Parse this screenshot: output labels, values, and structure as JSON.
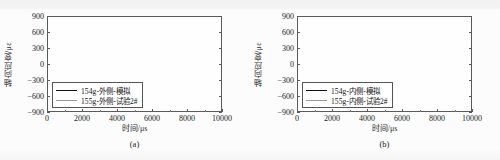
{
  "figure": {
    "background_color": "#fbfbfb",
    "axis_color": "#5a5a5a",
    "sim_color": "#111111",
    "exp_color": "#9a9a9a"
  },
  "panels": [
    {
      "id": "a",
      "caption": "(a)",
      "ylabel": "轴向应变/με",
      "xlabel": "时间/μs",
      "yticks": [
        "900",
        "600",
        "300",
        "0",
        "-300",
        "-600",
        "-900"
      ],
      "xticks": [
        "0",
        "2000",
        "4000",
        "6000",
        "8000",
        "10000"
      ],
      "legend": [
        {
          "label": "154g-外侧-模拟",
          "key": "sim"
        },
        {
          "label": "155g-外侧-试验2#",
          "key": "exp"
        }
      ]
    },
    {
      "id": "b",
      "caption": "(b)",
      "ylabel": "轴向应变/με",
      "xlabel": "时间/μs",
      "yticks": [
        "900",
        "600",
        "300",
        "0",
        "-300",
        "-600",
        "-900"
      ],
      "xticks": [
        "0",
        "2000",
        "4000",
        "6000",
        "8000",
        "10000"
      ],
      "legend": [
        {
          "label": "154g-内侧-模拟",
          "key": "sim"
        },
        {
          "label": "155g-内侧-试验2#",
          "key": "exp"
        }
      ]
    }
  ],
  "chart_data": [
    {
      "type": "line",
      "panel": "a",
      "title": "",
      "xlabel": "时间/μs",
      "ylabel": "轴向应变/με",
      "xlim": [
        0,
        10000
      ],
      "ylim": [
        -900,
        900
      ],
      "xticks": [
        0,
        2000,
        4000,
        6000,
        8000,
        10000
      ],
      "yticks": [
        -900,
        -600,
        -300,
        0,
        300,
        600,
        900
      ],
      "grid": false,
      "legend_position": "lower-left-inside",
      "series": [
        {
          "name": "154g-外侧-模拟",
          "color": "#111111",
          "x": [
            0,
            100,
            200,
            300,
            400,
            500,
            600,
            700,
            800,
            900,
            1000,
            1100,
            1200,
            1300,
            1400,
            1500,
            1600,
            1700,
            1800,
            1900,
            2000,
            2100,
            2200,
            2300,
            2400,
            2500,
            2600,
            2700,
            2800,
            2900,
            3000,
            3100,
            3200,
            3300,
            3400,
            3500,
            3600,
            3700,
            3800,
            3900,
            4000,
            4100,
            4200,
            4300,
            4400,
            4500,
            4600,
            4700,
            4800,
            4900,
            5000,
            5100,
            5200,
            5300,
            5400,
            5500,
            5600,
            5700,
            5800,
            5900,
            6000,
            6100,
            6200,
            6300,
            6400,
            6500,
            6600,
            6700,
            6800,
            6900,
            7000,
            7100,
            7200,
            7300,
            7400,
            7500,
            7600,
            7700,
            7800,
            7900,
            8000,
            8100,
            8200,
            8300,
            8400,
            8500,
            8600,
            8700,
            8800,
            8900,
            9000,
            9100,
            9200,
            9300,
            9400,
            9500,
            9600,
            9700,
            9800,
            9900,
            10000
          ],
          "values": [
            0,
            10,
            -20,
            30,
            -30,
            60,
            -90,
            -130,
            60,
            -60,
            100,
            -150,
            90,
            -40,
            130,
            -80,
            170,
            -140,
            210,
            -120,
            250,
            -170,
            330,
            -200,
            420,
            -230,
            520,
            -260,
            400,
            -280,
            560,
            -250,
            330,
            -300,
            450,
            -210,
            380,
            -270,
            310,
            -240,
            420,
            -200,
            330,
            -280,
            470,
            -230,
            360,
            -300,
            410,
            -250,
            330,
            -290,
            440,
            -220,
            370,
            -310,
            300,
            -260,
            420,
            -240,
            350,
            -300,
            330,
            -270,
            410,
            -230,
            480,
            -330,
            420,
            -290,
            520,
            -350,
            380,
            -300,
            470,
            -320,
            400,
            -280,
            450,
            -330,
            520,
            -300,
            380,
            -360,
            470,
            -320,
            550,
            -380,
            420,
            -330,
            610,
            -420,
            500,
            -360,
            680,
            -470,
            430,
            -330,
            520,
            -300,
            300
          ]
        },
        {
          "name": "155g-外侧-试验2#",
          "color": "#9a9a9a",
          "x": [
            0,
            100,
            200,
            300,
            400,
            500,
            600,
            700,
            800,
            900,
            1000,
            1100,
            1200,
            1300,
            1400,
            1500,
            1600,
            1700,
            1800,
            1900,
            2000,
            2100,
            2200,
            2300,
            2400,
            2500,
            2600,
            2700,
            2800,
            2900,
            3000,
            3100,
            3200,
            3300,
            3400,
            3500,
            3600,
            3700,
            3800,
            3900,
            4000,
            4100,
            4200,
            4300,
            4400,
            4500,
            4600,
            4700,
            4800,
            4900,
            5000,
            5100,
            5200,
            5300,
            5400,
            5500,
            5600,
            5700,
            5800,
            5900,
            6000,
            6100,
            6200,
            6300,
            6400,
            6500,
            6600,
            6700,
            6800,
            6900,
            7000,
            7100,
            7200,
            7300,
            7400,
            7500,
            7600,
            7700,
            7800,
            7900,
            8000,
            8100,
            8200,
            8300,
            8400,
            8500,
            8600,
            8700,
            8800,
            8900,
            9000,
            9100,
            9200,
            9300,
            9400,
            9500,
            9600,
            9700,
            9800,
            9900,
            10000
          ],
          "values": [
            0,
            5,
            -15,
            20,
            -40,
            40,
            -120,
            -290,
            30,
            -100,
            70,
            -190,
            60,
            -70,
            100,
            -120,
            140,
            -180,
            180,
            -160,
            220,
            -210,
            300,
            -240,
            390,
            -270,
            490,
            -300,
            370,
            -310,
            530,
            -280,
            300,
            -330,
            420,
            -250,
            350,
            -300,
            280,
            -270,
            390,
            -240,
            300,
            -310,
            440,
            -260,
            330,
            -330,
            380,
            -280,
            300,
            -320,
            410,
            -250,
            340,
            -340,
            270,
            -290,
            390,
            -270,
            320,
            -330,
            300,
            -300,
            380,
            -270,
            450,
            -360,
            390,
            -320,
            490,
            -380,
            350,
            -330,
            440,
            -350,
            370,
            -310,
            420,
            -360,
            490,
            -330,
            350,
            -390,
            440,
            -350,
            520,
            -410,
            390,
            -360,
            580,
            -450,
            470,
            -390,
            650,
            -500,
            400,
            -360,
            490,
            -330,
            270
          ]
        }
      ]
    },
    {
      "type": "line",
      "panel": "b",
      "title": "",
      "xlabel": "时间/μs",
      "ylabel": "轴向应变/με",
      "xlim": [
        0,
        10000
      ],
      "ylim": [
        -900,
        900
      ],
      "xticks": [
        0,
        2000,
        4000,
        6000,
        8000,
        10000
      ],
      "yticks": [
        -900,
        -600,
        -300,
        0,
        300,
        600,
        900
      ],
      "grid": false,
      "legend_position": "lower-left-inside",
      "series": [
        {
          "name": "154g-内侧-模拟",
          "color": "#111111",
          "x": [
            0,
            100,
            200,
            300,
            400,
            500,
            600,
            700,
            800,
            900,
            1000,
            1100,
            1200,
            1300,
            1400,
            1500,
            1600,
            1700,
            1800,
            1900,
            2000,
            2100,
            2200,
            2300,
            2400,
            2500,
            2600,
            2700,
            2800,
            2900,
            3000,
            3100,
            3200,
            3300,
            3400,
            3500,
            3600,
            3700,
            3800,
            3900,
            4000,
            4100,
            4200,
            4300,
            4400,
            4500,
            4600,
            4700,
            4800,
            4900,
            5000,
            5100,
            5200,
            5300,
            5400,
            5500,
            5600,
            5700,
            5800,
            5900,
            6000,
            6100,
            6200,
            6300,
            6400,
            6500,
            6600,
            6700,
            6800,
            6900,
            7000,
            7100,
            7200,
            7300,
            7400,
            7500,
            7600,
            7700,
            7800,
            7900,
            8000,
            8100,
            8200,
            8300,
            8400,
            8500,
            8600,
            8700,
            8800,
            8900,
            9000,
            9100,
            9200,
            9300,
            9400,
            9500,
            9600,
            9700,
            9800,
            9900,
            10000
          ],
          "values": [
            0,
            30,
            -20,
            60,
            20,
            120,
            60,
            180,
            90,
            250,
            120,
            330,
            180,
            520,
            240,
            400,
            160,
            300,
            120,
            380,
            200,
            560,
            300,
            620,
            280,
            400,
            180,
            -280,
            60,
            -310,
            200,
            520,
            260,
            340,
            140,
            260,
            80,
            200,
            120,
            300,
            160,
            240,
            60,
            180,
            40,
            220,
            100,
            300,
            140,
            380,
            180,
            260,
            100,
            520,
            200,
            620,
            300,
            380,
            160,
            300,
            200,
            620,
            280,
            400,
            180,
            300,
            120,
            380,
            160,
            280,
            100,
            220,
            140,
            300,
            180,
            360,
            120,
            260,
            80,
            -260,
            140,
            620,
            300,
            420,
            200,
            300,
            140,
            420,
            180,
            320,
            120,
            520,
            240,
            360,
            160,
            300,
            200,
            380,
            160,
            200
          ]
        },
        {
          "name": "155g-内侧-试验2#",
          "color": "#9a9a9a",
          "x": [
            0,
            100,
            200,
            300,
            400,
            500,
            600,
            700,
            800,
            900,
            1000,
            1100,
            1200,
            1300,
            1400,
            1500,
            1600,
            1700,
            1800,
            1900,
            2000,
            2100,
            2200,
            2300,
            2400,
            2500,
            2600,
            2700,
            2800,
            2900,
            3000,
            3100,
            3200,
            3300,
            3400,
            3500,
            3600,
            3700,
            3800,
            3900,
            4000,
            4100,
            4200,
            4300,
            4400,
            4500,
            4600,
            4700,
            4800,
            4900,
            5000,
            5100,
            5200,
            5300,
            5400,
            5500,
            5600,
            5700,
            5800,
            5900,
            6000,
            6100,
            6200,
            6300,
            6400,
            6500,
            6600,
            6700,
            6800,
            6900,
            7000,
            7100,
            7200,
            7300,
            7400,
            7500,
            7600,
            7700,
            7800,
            7900,
            8000,
            8100,
            8200,
            8300,
            8400,
            8500,
            8600,
            8700,
            8800,
            8900,
            9000,
            9100,
            9200,
            9300,
            9400,
            9500,
            9600,
            9700,
            9800,
            9900,
            10000
          ],
          "values": [
            0,
            -20,
            -60,
            10,
            -80,
            40,
            -60,
            90,
            -40,
            140,
            0,
            200,
            60,
            320,
            100,
            200,
            40,
            120,
            -20,
            180,
            60,
            300,
            120,
            380,
            100,
            200,
            20,
            -180,
            -40,
            -200,
            60,
            260,
            100,
            160,
            20,
            100,
            -40,
            60,
            0,
            140,
            40,
            100,
            -60,
            60,
            -80,
            100,
            0,
            160,
            40,
            220,
            60,
            140,
            -20,
            300,
            80,
            380,
            140,
            200,
            40,
            140,
            60,
            380,
            120,
            220,
            40,
            140,
            0,
            200,
            40,
            140,
            -20,
            100,
            20,
            160,
            60,
            200,
            20,
            120,
            -40,
            -160,
            40,
            360,
            140,
            240,
            80,
            160,
            40,
            240,
            60,
            180,
            20,
            300,
            100,
            200,
            40,
            140,
            80,
            220,
            60,
            100
          ]
        }
      ]
    }
  ]
}
